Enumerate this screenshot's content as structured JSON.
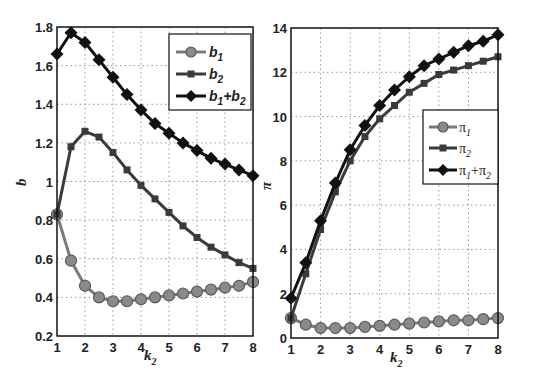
{
  "chart_data": [
    {
      "type": "line",
      "title": "",
      "xlabel": "k2",
      "ylabel": "b",
      "xlim": [
        1,
        8
      ],
      "ylim": [
        0.2,
        1.8
      ],
      "xticks": [
        1,
        2,
        3,
        4,
        5,
        6,
        7,
        8
      ],
      "yticks": [
        0.2,
        0.4,
        0.6,
        0.8,
        1.0,
        1.2,
        1.4,
        1.6,
        1.8
      ],
      "ytick_labels": [
        "0.2",
        "0.4",
        "0.6",
        "0.8",
        "1",
        "1.2",
        "1.4",
        "1.6",
        "1.8"
      ],
      "grid": true,
      "legend_position": "upper right",
      "x": [
        1,
        1.5,
        2,
        2.5,
        3,
        3.5,
        4,
        4.5,
        5,
        5.5,
        6,
        6.5,
        7,
        7.5,
        8
      ],
      "series": [
        {
          "name": "b1",
          "marker": "circle",
          "color": "#7a7a7a",
          "values": [
            0.83,
            0.59,
            0.46,
            0.4,
            0.38,
            0.38,
            0.39,
            0.4,
            0.41,
            0.42,
            0.43,
            0.44,
            0.45,
            0.46,
            0.48
          ]
        },
        {
          "name": "b2",
          "marker": "square",
          "color": "#3a3a3a",
          "values": [
            0.83,
            1.18,
            1.26,
            1.23,
            1.15,
            1.06,
            0.98,
            0.91,
            0.84,
            0.77,
            0.71,
            0.66,
            0.62,
            0.58,
            0.55
          ]
        },
        {
          "name": "b1+b2",
          "marker": "diamond",
          "color": "#111111",
          "values": [
            1.66,
            1.77,
            1.72,
            1.63,
            1.54,
            1.45,
            1.37,
            1.3,
            1.25,
            1.2,
            1.16,
            1.12,
            1.09,
            1.06,
            1.03
          ]
        }
      ]
    },
    {
      "type": "line",
      "title": "",
      "xlabel": "k2",
      "ylabel": "π",
      "xlim": [
        1,
        8
      ],
      "ylim": [
        0,
        14
      ],
      "xticks": [
        1,
        2,
        3,
        4,
        5,
        6,
        7,
        8
      ],
      "yticks": [
        0,
        2,
        4,
        6,
        8,
        10,
        12,
        14
      ],
      "ytick_labels": [
        "0",
        "2",
        "4",
        "6",
        "8",
        "10",
        "12",
        "14"
      ],
      "grid": true,
      "legend_position": "center right",
      "x": [
        1,
        1.5,
        2,
        2.5,
        3,
        3.5,
        4,
        4.5,
        5,
        5.5,
        6,
        6.5,
        7,
        7.5,
        8
      ],
      "series": [
        {
          "name": "π1",
          "marker": "circle",
          "color": "#7a7a7a",
          "values": [
            0.9,
            0.6,
            0.45,
            0.45,
            0.45,
            0.5,
            0.55,
            0.6,
            0.65,
            0.7,
            0.75,
            0.8,
            0.8,
            0.85,
            0.9
          ]
        },
        {
          "name": "π2",
          "marker": "square",
          "color": "#3a3a3a",
          "values": [
            0.9,
            2.9,
            4.9,
            6.6,
            8.0,
            9.1,
            9.9,
            10.5,
            11.1,
            11.5,
            11.9,
            12.1,
            12.3,
            12.5,
            12.7
          ]
        },
        {
          "name": "π1+π2",
          "marker": "diamond",
          "color": "#111111",
          "values": [
            1.8,
            3.4,
            5.3,
            7.0,
            8.5,
            9.6,
            10.5,
            11.2,
            11.8,
            12.3,
            12.6,
            12.9,
            13.2,
            13.4,
            13.7
          ]
        }
      ]
    }
  ],
  "left": {
    "ylabel": "b",
    "xlabel_main": "k",
    "xlabel_sub": "2",
    "legend": [
      {
        "main": "b",
        "sub": "1"
      },
      {
        "main": "b",
        "sub": "2"
      },
      {
        "main1": "b",
        "sub1": "1",
        "plus": "+",
        "main2": "b",
        "sub2": "2"
      }
    ]
  },
  "right": {
    "ylabel": "π",
    "xlabel_main": "k",
    "xlabel_sub": "2",
    "legend": [
      {
        "main": "π",
        "sub": "1"
      },
      {
        "main": "π",
        "sub": "2"
      },
      {
        "main1": "π",
        "sub1": "1",
        "plus": "+",
        "main2": "π",
        "sub2": "2"
      }
    ]
  }
}
